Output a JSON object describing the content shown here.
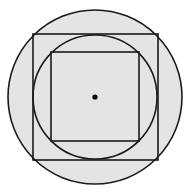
{
  "diagram": {
    "colors": {
      "fill": "#e4e4e4",
      "stroke": "#1a1a1a",
      "background": "#ffffff",
      "center_dot": "#000000"
    },
    "outer_circle": {
      "cx": 95,
      "cy": 97,
      "r": 87
    },
    "outer_square": {
      "x": 33,
      "y": 34,
      "w": 125,
      "h": 126
    },
    "inner_circle": {
      "cx": 95,
      "cy": 97,
      "r": 62
    },
    "inner_square": {
      "x": 51,
      "y": 52,
      "w": 88,
      "h": 89
    },
    "center_point": {
      "cx": 95,
      "cy": 97,
      "r": 3
    }
  }
}
